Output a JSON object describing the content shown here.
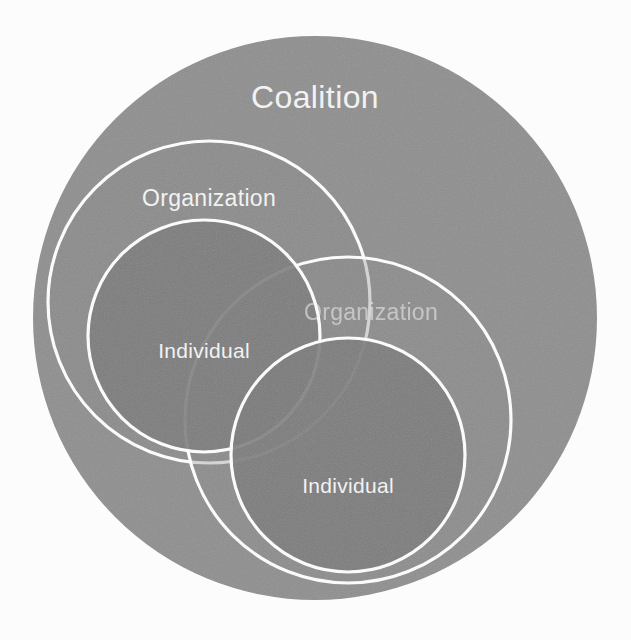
{
  "diagram": {
    "background_color": "#fcfcfc",
    "stroke_color": "#ffffff",
    "levels": [
      "Coalition",
      "Organization",
      "Individual"
    ],
    "colors": {
      "coalition_fill": "#8e8e8e",
      "organization_fill": "#858585",
      "individual_fill": "#787878",
      "stroke": "#ffffff",
      "label_text": "#f2f2f2"
    },
    "shapes": [
      {
        "id": "coalition",
        "label": "Coalition",
        "level": "Coalition",
        "cx": 315,
        "cy": 318,
        "r": 282,
        "fill": "#8e8e8e",
        "stroke": "none",
        "label_x": 315,
        "label_y": 100,
        "label_visible": true
      },
      {
        "id": "organization-left",
        "label": "Organization",
        "level": "Organization",
        "cx": 209,
        "cy": 302,
        "r": 161,
        "fill": "#858585",
        "stroke": "#ffffff",
        "label_x": 209,
        "label_y": 200,
        "label_visible": true
      },
      {
        "id": "organization-right",
        "label": "Organization",
        "level": "Organization",
        "cx": 348,
        "cy": 420,
        "r": 163,
        "fill": "#858585",
        "stroke": "#ffffff",
        "label_x": 371,
        "label_y": 314,
        "label_visible": true,
        "occluded": true
      },
      {
        "id": "individual-left",
        "label": "Individual",
        "level": "Individual",
        "cx": 204,
        "cy": 336,
        "r": 116,
        "fill": "#787878",
        "stroke": "#ffffff",
        "label_x": 204,
        "label_y": 352,
        "label_visible": true
      },
      {
        "id": "individual-right",
        "label": "Individual",
        "level": "Individual",
        "cx": 348,
        "cy": 455,
        "r": 117,
        "fill": "#787878",
        "stroke": "#ffffff",
        "label_x": 348,
        "label_y": 487,
        "label_visible": true
      }
    ]
  },
  "labels": {
    "coalition": "Coalition",
    "organization_left": "Organization",
    "organization_right": "Organization",
    "individual_left": "Individual",
    "individual_right": "Individual"
  }
}
